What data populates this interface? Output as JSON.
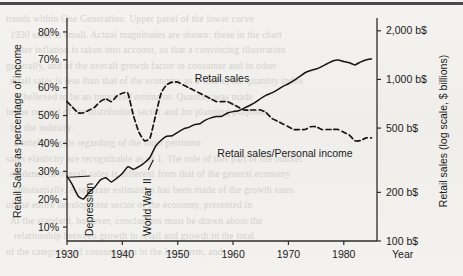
{
  "page": {
    "background_color": "#f2f1ee",
    "ink_color": "#141414",
    "top_rule": true,
    "bleed_through_lines": [
      "trends within One Generation. Upper panel of the lower curve",
      "1930 scale is small. Actual magnitudes are shown: these in the chart",
      "after inflation is taken into account, so that a convincing illustration",
      "generally, and of the overall growth factor in consumer and in other",
      "retail sales is less than that of the economy as a whole, the quantity index",
      "is believed to be an improved estimator. Quantity was made",
      "in the context of the distribution sector and for planning purposes",
      "for the industry.",
      "a brief analysis regarding of the most pertinent",
      "sales elasticity are recognizable as of 1. The role of this part of the market",
      "evidence of overall sales is different from that of the general economy",
      "substantially. A separate estimation has been made of the growth rates",
      "of the entire development sector of the economy, presented in",
      "At the standard, however, conclusions must be drawn about the",
      "relationship between growth in retail and growth in the total",
      "of the categories of consumption in the long term, and"
    ]
  },
  "chart_data": {
    "type": "line",
    "title": "",
    "xlabel": "Year",
    "ylabel": "Retail Sales as percentage of income",
    "y2label": "Retail sales (log scale, $ billions)",
    "xlim": [
      1930,
      1986
    ],
    "xticks": [
      1930,
      1940,
      1950,
      1960,
      1970,
      1980
    ],
    "xticklabels": [
      "1930",
      "1940",
      "1950",
      "1960",
      "1970",
      "1980"
    ],
    "ylim": [
      5,
      85
    ],
    "yticks": [
      10,
      20,
      30,
      40,
      50,
      60,
      70,
      80
    ],
    "yticklabels": [
      "10%",
      "20%",
      "30%",
      "40%",
      "50%",
      "60%",
      "70%",
      "80%"
    ],
    "y2_scale": "log",
    "y2lim": [
      100,
      2400
    ],
    "y2ticks": [
      100,
      200,
      500,
      1000,
      2000
    ],
    "y2ticklabels": [
      "100 b$",
      "200 b$",
      "500 b$",
      "1,000 b$",
      "2,000 b$"
    ],
    "grid": false,
    "legend": "inline-labels",
    "annotations": [
      {
        "text": "Depression",
        "x": 1934,
        "rotated": true
      },
      {
        "text": "World War II",
        "x": 1944.5,
        "rotated": true
      }
    ],
    "series": [
      {
        "name": "Retail sales",
        "axis": "right",
        "units": "billions of dollars (log scale)",
        "style": "solid",
        "label_x": 1958,
        "x": [
          1930,
          1931,
          1932,
          1933,
          1934,
          1935,
          1936,
          1937,
          1938,
          1939,
          1940,
          1941,
          1942,
          1943,
          1944,
          1945,
          1946,
          1947,
          1948,
          1949,
          1950,
          1951,
          1952,
          1953,
          1954,
          1955,
          1956,
          1957,
          1958,
          1959,
          1960,
          1961,
          1962,
          1963,
          1964,
          1965,
          1966,
          1967,
          1968,
          1969,
          1970,
          1971,
          1972,
          1973,
          1974,
          1975,
          1976,
          1977,
          1978,
          1979,
          1980,
          1981,
          1982,
          1983,
          1984,
          1985
        ],
        "values": [
          252,
          222,
          190,
          182,
          200,
          215,
          238,
          246,
          232,
          245,
          262,
          288,
          278,
          289,
          305,
          330,
          386,
          420,
          445,
          448,
          470,
          493,
          505,
          525,
          532,
          560,
          578,
          590,
          592,
          620,
          632,
          640,
          665,
          690,
          720,
          762,
          800,
          825,
          862,
          905,
          940,
          985,
          1040,
          1100,
          1135,
          1160,
          1200,
          1250,
          1300,
          1320,
          1290,
          1270,
          1230,
          1280,
          1320,
          1340
        ]
      },
      {
        "name": "Retail sales/Personal income",
        "axis": "left",
        "units": "percent",
        "style": "dashed",
        "label_x": 1966,
        "x": [
          1930,
          1931,
          1932,
          1933,
          1934,
          1935,
          1936,
          1937,
          1938,
          1939,
          1940,
          1941,
          1942,
          1943,
          1944,
          1945,
          1946,
          1947,
          1948,
          1949,
          1950,
          1951,
          1952,
          1953,
          1954,
          1955,
          1956,
          1957,
          1958,
          1959,
          1960,
          1961,
          1962,
          1963,
          1964,
          1965,
          1966,
          1967,
          1968,
          1969,
          1970,
          1971,
          1972,
          1973,
          1974,
          1975,
          1976,
          1977,
          1978,
          1979,
          1980,
          1981,
          1982,
          1983,
          1984,
          1985
        ],
        "values": [
          55,
          53,
          51,
          51,
          52,
          53,
          55,
          56,
          55,
          57,
          58,
          58,
          50,
          44,
          41,
          42,
          50,
          58,
          61,
          62,
          62,
          61,
          60,
          59,
          58,
          57,
          56,
          55,
          55,
          55,
          54,
          53,
          52,
          52,
          52,
          52,
          51,
          49,
          48,
          47,
          46,
          45,
          45,
          45,
          46,
          46,
          45,
          45,
          45,
          45,
          44,
          43,
          41,
          41,
          42,
          42
        ]
      }
    ]
  }
}
